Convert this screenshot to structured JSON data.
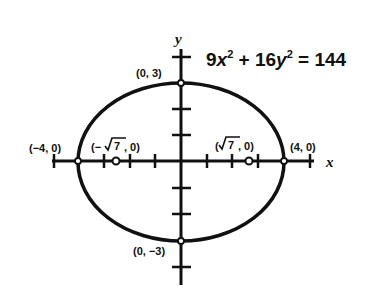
{
  "equation": {
    "coef_x": "9",
    "var_x": "x",
    "exp_x": "2",
    "plus": " + ",
    "coef_y": "16",
    "var_y": "y",
    "exp_y": "2",
    "rhs": " = 144"
  },
  "axes": {
    "x_label": "x",
    "y_label": "y"
  },
  "points": {
    "top_vertex": "(0, 3)",
    "bottom_vertex": "(0, −3)",
    "left_vertex": "(−4, 0)",
    "right_vertex": "(4, 0)",
    "left_focus_prefix": "(−",
    "left_focus_radicand": "7",
    "left_focus_suffix": ", 0)",
    "right_focus_prefix": "(",
    "right_focus_radicand": "7",
    "right_focus_suffix": ", 0)"
  },
  "colors": {
    "ink": "#111111",
    "background": "#ffffff"
  }
}
